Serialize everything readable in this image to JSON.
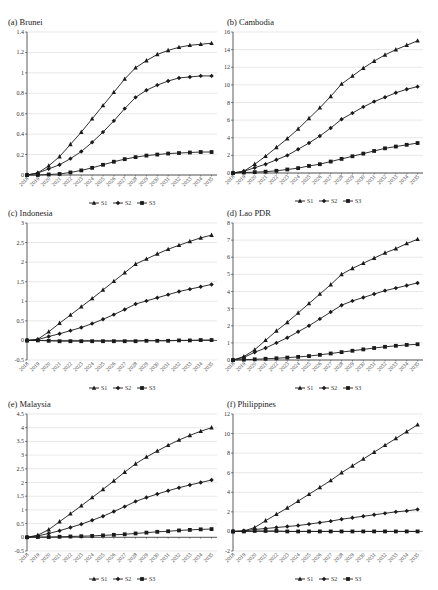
{
  "chart_data": [
    {
      "type": "line",
      "title": "(a) Brunei",
      "xlabel": "",
      "ylabel": "",
      "categories": [
        "2018",
        "2019",
        "2020",
        "2021",
        "2022",
        "2023",
        "2024",
        "2025",
        "2026",
        "2027",
        "2028",
        "2029",
        "2030",
        "2031",
        "2032",
        "2033",
        "2034",
        "2035"
      ],
      "yticks": [
        0,
        0.2,
        0.4,
        0.6,
        0.8,
        1,
        1.2,
        1.4
      ],
      "ytick_labels": [
        "0",
        "0.2",
        "0.4",
        "0.6",
        "0.8",
        "1",
        "1.2",
        "1.4"
      ],
      "ylim": [
        0,
        1.4
      ],
      "grid": true,
      "legend_position": "bottom",
      "series": [
        {
          "name": "S1",
          "marker": "triangle",
          "values": [
            0,
            0.02,
            0.09,
            0.18,
            0.3,
            0.42,
            0.55,
            0.68,
            0.81,
            0.94,
            1.05,
            1.12,
            1.18,
            1.22,
            1.25,
            1.27,
            1.28,
            1.29
          ]
        },
        {
          "name": "S2",
          "marker": "diamond",
          "values": [
            0,
            0.02,
            0.06,
            0.1,
            0.16,
            0.23,
            0.32,
            0.42,
            0.53,
            0.65,
            0.76,
            0.83,
            0.88,
            0.92,
            0.95,
            0.96,
            0.97,
            0.97
          ]
        },
        {
          "name": "S3",
          "marker": "square",
          "values": [
            0,
            0,
            0.005,
            0.01,
            0.025,
            0.045,
            0.07,
            0.1,
            0.13,
            0.155,
            0.175,
            0.19,
            0.2,
            0.21,
            0.215,
            0.22,
            0.225,
            0.225
          ]
        }
      ]
    },
    {
      "type": "line",
      "title": "(b) Cambodia",
      "xlabel": "",
      "ylabel": "",
      "categories": [
        "2018",
        "2019",
        "2020",
        "2021",
        "2022",
        "2023",
        "2024",
        "2025",
        "2026",
        "2027",
        "2028",
        "2029",
        "2030",
        "2031",
        "2032",
        "2033",
        "2034",
        "2035"
      ],
      "yticks": [
        0,
        2,
        4,
        6,
        8,
        10,
        12,
        14,
        16
      ],
      "ytick_labels": [
        "0",
        "2",
        "4",
        "6",
        "8",
        "10",
        "12",
        "14",
        "16"
      ],
      "ylim": [
        0,
        16
      ],
      "grid": true,
      "legend_position": "bottom",
      "series": [
        {
          "name": "S1",
          "marker": "triangle",
          "values": [
            0,
            0.2,
            1.0,
            1.9,
            2.9,
            3.9,
            5.0,
            6.2,
            7.4,
            8.7,
            10.1,
            11.0,
            11.9,
            12.7,
            13.4,
            14.0,
            14.5,
            15.0
          ]
        },
        {
          "name": "S2",
          "marker": "diamond",
          "values": [
            0,
            0.2,
            0.6,
            1.0,
            1.5,
            2.0,
            2.7,
            3.4,
            4.2,
            5.1,
            6.1,
            6.8,
            7.5,
            8.1,
            8.6,
            9.1,
            9.5,
            9.8
          ]
        },
        {
          "name": "S3",
          "marker": "square",
          "values": [
            0,
            0.05,
            0.1,
            0.15,
            0.25,
            0.4,
            0.55,
            0.8,
            1.0,
            1.3,
            1.6,
            1.9,
            2.2,
            2.5,
            2.8,
            3.0,
            3.2,
            3.4
          ]
        }
      ]
    },
    {
      "type": "line",
      "title": "(c) Indonesia",
      "xlabel": "",
      "ylabel": "",
      "categories": [
        "2018",
        "2019",
        "2020",
        "2021",
        "2022",
        "2023",
        "2024",
        "2025",
        "2026",
        "2027",
        "2028",
        "2029",
        "2030",
        "2031",
        "2032",
        "2033",
        "2034",
        "2035"
      ],
      "yticks": [
        -0.5,
        0,
        0.5,
        1,
        1.5,
        2,
        2.5,
        3
      ],
      "ytick_labels": [
        "-0.5",
        "0",
        "0.5",
        "1",
        "1.5",
        "2",
        "2.5",
        "3"
      ],
      "ylim": [
        -0.5,
        3
      ],
      "grid": true,
      "legend_position": "bottom",
      "series": [
        {
          "name": "S1",
          "marker": "triangle",
          "values": [
            0,
            0.03,
            0.22,
            0.44,
            0.65,
            0.86,
            1.07,
            1.29,
            1.51,
            1.73,
            1.95,
            2.08,
            2.21,
            2.33,
            2.43,
            2.53,
            2.62,
            2.69
          ]
        },
        {
          "name": "S2",
          "marker": "diamond",
          "values": [
            0,
            0.02,
            0.1,
            0.17,
            0.25,
            0.33,
            0.43,
            0.54,
            0.66,
            0.79,
            0.93,
            1.01,
            1.09,
            1.17,
            1.25,
            1.31,
            1.37,
            1.43
          ]
        },
        {
          "name": "S3",
          "marker": "square",
          "values": [
            0,
            0,
            -0.01,
            -0.02,
            -0.02,
            -0.02,
            -0.02,
            -0.02,
            -0.02,
            -0.02,
            -0.02,
            -0.01,
            -0.01,
            -0.01,
            0,
            0,
            0.01,
            0.01
          ]
        }
      ]
    },
    {
      "type": "line",
      "title": "(d) Lao PDR",
      "xlabel": "",
      "ylabel": "",
      "categories": [
        "2018",
        "2019",
        "2020",
        "2021",
        "2022",
        "2023",
        "2024",
        "2025",
        "2026",
        "2027",
        "2028",
        "2029",
        "2030",
        "2031",
        "2032",
        "2033",
        "2034",
        "2035"
      ],
      "yticks": [
        0,
        1,
        2,
        3,
        4,
        5,
        6,
        7,
        8
      ],
      "ytick_labels": [
        "0",
        "1",
        "2",
        "3",
        "4",
        "5",
        "6",
        "7",
        "8"
      ],
      "ylim": [
        0,
        8
      ],
      "grid": true,
      "legend_position": "bottom",
      "series": [
        {
          "name": "S1",
          "marker": "triangle",
          "values": [
            0,
            0.2,
            0.6,
            1.15,
            1.7,
            2.2,
            2.75,
            3.3,
            3.85,
            4.4,
            5.0,
            5.35,
            5.65,
            5.95,
            6.25,
            6.5,
            6.8,
            7.05
          ]
        },
        {
          "name": "S2",
          "marker": "diamond",
          "values": [
            0,
            0.15,
            0.45,
            0.7,
            1.0,
            1.3,
            1.65,
            2.0,
            2.4,
            2.8,
            3.2,
            3.45,
            3.65,
            3.85,
            4.05,
            4.2,
            4.35,
            4.5
          ]
        },
        {
          "name": "S3",
          "marker": "square",
          "values": [
            0,
            0.02,
            0.04,
            0.07,
            0.1,
            0.14,
            0.18,
            0.23,
            0.3,
            0.38,
            0.46,
            0.54,
            0.62,
            0.7,
            0.77,
            0.83,
            0.88,
            0.92
          ]
        }
      ]
    },
    {
      "type": "line",
      "title": "(e) Malaysia",
      "xlabel": "",
      "ylabel": "",
      "categories": [
        "2018",
        "2019",
        "2020",
        "2021",
        "2022",
        "2023",
        "2024",
        "2025",
        "2026",
        "2027",
        "2028",
        "2029",
        "2030",
        "2031",
        "2032",
        "2033",
        "2034",
        "2035"
      ],
      "yticks": [
        -0.5,
        0,
        0.5,
        1,
        1.5,
        2,
        2.5,
        3,
        3.5,
        4,
        4.5
      ],
      "ytick_labels": [
        "-0.5",
        "0",
        "0.5",
        "1",
        "1.5",
        "2",
        "2.5",
        "3",
        "3.5",
        "4",
        "4.5"
      ],
      "ylim": [
        -0.5,
        4.5
      ],
      "grid": true,
      "legend_position": "bottom",
      "series": [
        {
          "name": "S1",
          "marker": "triangle",
          "values": [
            0,
            0.08,
            0.28,
            0.57,
            0.86,
            1.15,
            1.45,
            1.75,
            2.06,
            2.38,
            2.68,
            2.93,
            3.15,
            3.36,
            3.55,
            3.72,
            3.87,
            4.0
          ]
        },
        {
          "name": "S2",
          "marker": "diamond",
          "values": [
            0,
            0.05,
            0.14,
            0.24,
            0.36,
            0.48,
            0.62,
            0.77,
            0.94,
            1.12,
            1.31,
            1.45,
            1.58,
            1.7,
            1.81,
            1.91,
            2.0,
            2.09
          ]
        },
        {
          "name": "S3",
          "marker": "square",
          "values": [
            0,
            0.01,
            0.01,
            0.02,
            0.03,
            0.04,
            0.05,
            0.07,
            0.09,
            0.11,
            0.14,
            0.17,
            0.2,
            0.22,
            0.25,
            0.27,
            0.29,
            0.3
          ]
        }
      ]
    },
    {
      "type": "line",
      "title": "(f) Philippines",
      "xlabel": "",
      "ylabel": "",
      "categories": [
        "2018",
        "2019",
        "2020",
        "2021",
        "2022",
        "2023",
        "2024",
        "2025",
        "2026",
        "2027",
        "2028",
        "2029",
        "2030",
        "2031",
        "2032",
        "2033",
        "2034",
        "2035"
      ],
      "yticks": [
        -2,
        0,
        2,
        4,
        6,
        8,
        10,
        12
      ],
      "ytick_labels": [
        "-2",
        "0",
        "2",
        "4",
        "6",
        "8",
        "10",
        "12"
      ],
      "ylim": [
        -2,
        12
      ],
      "grid": true,
      "legend_position": "bottom",
      "series": [
        {
          "name": "S1",
          "marker": "triangle",
          "values": [
            0,
            0.05,
            0.4,
            1.1,
            1.75,
            2.4,
            3.1,
            3.8,
            4.5,
            5.2,
            6.0,
            6.7,
            7.4,
            8.1,
            8.8,
            9.5,
            10.2,
            10.9
          ]
        },
        {
          "name": "S2",
          "marker": "diamond",
          "values": [
            0,
            0.05,
            0.2,
            0.3,
            0.4,
            0.5,
            0.6,
            0.75,
            0.9,
            1.05,
            1.25,
            1.4,
            1.55,
            1.7,
            1.85,
            2.0,
            2.1,
            2.25
          ]
        },
        {
          "name": "S3",
          "marker": "square",
          "values": [
            0,
            0,
            0.05,
            0.05,
            0.05,
            0,
            0,
            0,
            0,
            0,
            0,
            0,
            0,
            0,
            0,
            0,
            0,
            0
          ]
        }
      ]
    }
  ],
  "legend": {
    "s1": "S1",
    "s2": "S2",
    "s3": "S3"
  },
  "colors": {
    "line": "#1a1a1a",
    "grid": "#d9d9d9",
    "axis": "#333333"
  }
}
